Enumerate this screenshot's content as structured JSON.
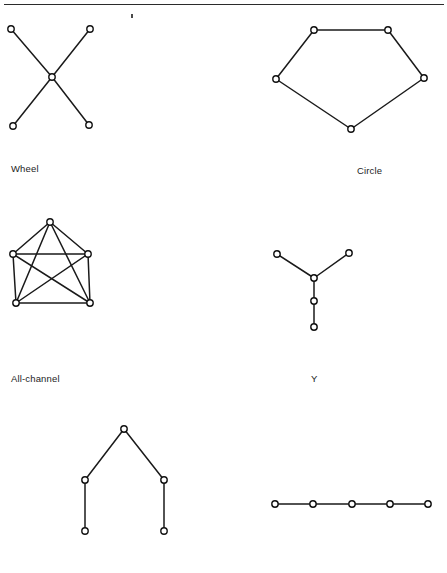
{
  "page": {
    "width": 447,
    "height": 573,
    "background": "#ffffff",
    "line_color": "#1a1a1a",
    "node_fill": "#ffffff",
    "node_stroke": "#111111",
    "top_rule_present": true,
    "stray_mark_present": true
  },
  "captions": {
    "wheel": "Wheel",
    "circle": "Circle",
    "all_channel": "All-channel",
    "y": "Y"
  },
  "chart_data": {
    "type": "diagram",
    "title": "",
    "subtitle": "",
    "diagrams": [
      {
        "id": "wheel",
        "label": "Wheel",
        "label_position": {
          "x": 11,
          "y": 163
        },
        "node_count": 5,
        "edge_count": 4,
        "nodes": [
          {
            "id": "n1",
            "x": 11,
            "y": 29,
            "role": "spoke-top-left"
          },
          {
            "id": "n2",
            "x": 90,
            "y": 29,
            "role": "spoke-top-right"
          },
          {
            "id": "n3",
            "x": 52,
            "y": 77,
            "role": "hub-center"
          },
          {
            "id": "n4",
            "x": 13,
            "y": 126,
            "role": "spoke-bottom-left"
          },
          {
            "id": "n5",
            "x": 89,
            "y": 125,
            "role": "spoke-bottom-right"
          }
        ],
        "edges": [
          [
            "n1",
            "n3"
          ],
          [
            "n2",
            "n3"
          ],
          [
            "n3",
            "n4"
          ],
          [
            "n3",
            "n5"
          ]
        ]
      },
      {
        "id": "circle",
        "label": "Circle",
        "label_position": {
          "x": 357,
          "y": 165
        },
        "node_count": 5,
        "edge_count": 5,
        "nodes": [
          {
            "id": "c1",
            "x": 314,
            "y": 30,
            "role": "top-left"
          },
          {
            "id": "c2",
            "x": 388,
            "y": 30,
            "role": "top-right"
          },
          {
            "id": "c3",
            "x": 424,
            "y": 78,
            "role": "right"
          },
          {
            "id": "c4",
            "x": 351,
            "y": 129,
            "role": "bottom"
          },
          {
            "id": "c5",
            "x": 276,
            "y": 79,
            "role": "left"
          }
        ],
        "edges": [
          [
            "c1",
            "c2"
          ],
          [
            "c2",
            "c3"
          ],
          [
            "c3",
            "c4"
          ],
          [
            "c4",
            "c5"
          ],
          [
            "c5",
            "c1"
          ]
        ]
      },
      {
        "id": "all-channel",
        "label": "All-channel",
        "label_position": {
          "x": 11,
          "y": 373
        },
        "node_count": 5,
        "edge_count": 10,
        "nodes": [
          {
            "id": "a1",
            "x": 50,
            "y": 222,
            "role": "apex"
          },
          {
            "id": "a2",
            "x": 13,
            "y": 254,
            "role": "upper-left"
          },
          {
            "id": "a3",
            "x": 88,
            "y": 254,
            "role": "upper-right"
          },
          {
            "id": "a4",
            "x": 16,
            "y": 303,
            "role": "lower-left"
          },
          {
            "id": "a5",
            "x": 90,
            "y": 303,
            "role": "lower-right"
          }
        ],
        "edges": [
          [
            "a1",
            "a2"
          ],
          [
            "a1",
            "a3"
          ],
          [
            "a1",
            "a4"
          ],
          [
            "a1",
            "a5"
          ],
          [
            "a2",
            "a3"
          ],
          [
            "a2",
            "a4"
          ],
          [
            "a2",
            "a5"
          ],
          [
            "a3",
            "a4"
          ],
          [
            "a3",
            "a5"
          ],
          [
            "a4",
            "a5"
          ]
        ]
      },
      {
        "id": "y",
        "label": "Y",
        "label_position": {
          "x": 311,
          "y": 373
        },
        "node_count": 5,
        "edge_count": 4,
        "nodes": [
          {
            "id": "y1",
            "x": 277,
            "y": 254,
            "role": "arm-left"
          },
          {
            "id": "y2",
            "x": 349,
            "y": 253,
            "role": "arm-right"
          },
          {
            "id": "y3",
            "x": 314,
            "y": 278,
            "role": "junction"
          },
          {
            "id": "y4",
            "x": 314,
            "y": 301,
            "role": "stem-middle"
          },
          {
            "id": "y5",
            "x": 314,
            "y": 327,
            "role": "stem-end"
          }
        ],
        "edges": [
          [
            "y1",
            "y3"
          ],
          [
            "y2",
            "y3"
          ],
          [
            "y3",
            "y4"
          ],
          [
            "y4",
            "y5"
          ]
        ]
      },
      {
        "id": "chain-inverted-y",
        "label": "",
        "node_count": 5,
        "edge_count": 4,
        "nodes": [
          {
            "id": "v1",
            "x": 124,
            "y": 429,
            "role": "apex"
          },
          {
            "id": "v2",
            "x": 85,
            "y": 480,
            "role": "left-mid"
          },
          {
            "id": "v3",
            "x": 164,
            "y": 480,
            "role": "right-mid"
          },
          {
            "id": "v4",
            "x": 85,
            "y": 531,
            "role": "left-end"
          },
          {
            "id": "v5",
            "x": 164,
            "y": 531,
            "role": "right-end"
          }
        ],
        "edges": [
          [
            "v1",
            "v2"
          ],
          [
            "v1",
            "v3"
          ],
          [
            "v2",
            "v4"
          ],
          [
            "v3",
            "v5"
          ]
        ]
      },
      {
        "id": "chain-linear",
        "label": "",
        "node_count": 5,
        "edge_count": 4,
        "nodes": [
          {
            "id": "l1",
            "x": 275,
            "y": 504,
            "role": "end-left"
          },
          {
            "id": "l2",
            "x": 313,
            "y": 504,
            "role": "link-2"
          },
          {
            "id": "l3",
            "x": 352,
            "y": 504,
            "role": "link-3"
          },
          {
            "id": "l4",
            "x": 390,
            "y": 504,
            "role": "link-4"
          },
          {
            "id": "l5",
            "x": 428,
            "y": 504,
            "role": "end-right"
          }
        ],
        "edges": [
          [
            "l1",
            "l2"
          ],
          [
            "l2",
            "l3"
          ],
          [
            "l3",
            "l4"
          ],
          [
            "l4",
            "l5"
          ]
        ]
      }
    ],
    "node_radius": 3.2
  }
}
